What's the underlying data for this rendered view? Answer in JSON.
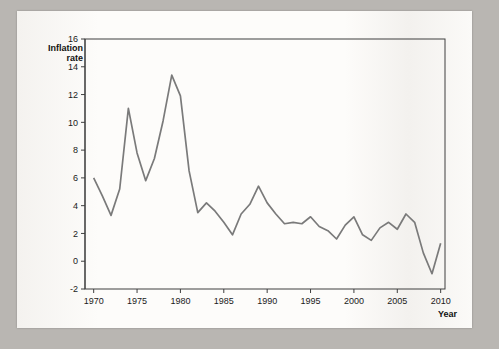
{
  "chart_data": {
    "type": "line",
    "title": "",
    "ylabel_line1": "Inflation",
    "ylabel_line2": "rate",
    "xlabel": "Year",
    "xlim": [
      1969,
      2010.5
    ],
    "ylim": [
      -2,
      16
    ],
    "yticks": [
      -2,
      0,
      2,
      4,
      6,
      8,
      10,
      12,
      14,
      16
    ],
    "xticks": [
      1970,
      1975,
      1980,
      1985,
      1990,
      1995,
      2000,
      2005,
      2010
    ],
    "grid": false,
    "legend": "none",
    "series": [
      {
        "name": "UK inflation rate",
        "color": "#7a7a7a",
        "x": [
          1970,
          1971,
          1972,
          1973,
          1974,
          1975,
          1976,
          1977,
          1978,
          1979,
          1980,
          1981,
          1982,
          1983,
          1984,
          1985,
          1986,
          1987,
          1988,
          1989,
          1990,
          1991,
          1992,
          1993,
          1994,
          1995,
          1996,
          1997,
          1998,
          1999,
          2000,
          2001,
          2002,
          2003,
          2004,
          2005,
          2006,
          2007,
          2008,
          2009,
          2010
        ],
        "y": [
          6.0,
          4.7,
          3.3,
          5.2,
          11.0,
          7.8,
          5.8,
          7.4,
          10.1,
          13.4,
          11.9,
          6.5,
          3.5,
          4.2,
          3.6,
          2.8,
          1.9,
          3.4,
          4.1,
          5.4,
          4.2,
          3.4,
          2.7,
          2.8,
          2.7,
          3.2,
          2.5,
          2.2,
          1.6,
          2.6,
          3.2,
          1.9,
          1.5,
          2.4,
          2.8,
          2.3,
          3.4,
          2.8,
          0.6,
          -0.9,
          1.3
        ]
      }
    ]
  },
  "page": {
    "plot_border": "#3f3f3f"
  }
}
